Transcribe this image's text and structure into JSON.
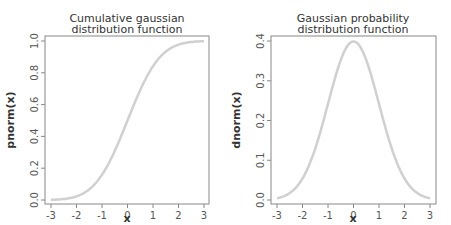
{
  "chart_data": [
    {
      "type": "line",
      "title": "Cumulative gaussian distribution function",
      "title_lines": [
        "Cumulative gaussian",
        "distribution function"
      ],
      "xlabel": "x",
      "ylabel": "pnorm(x)",
      "xlim": [
        -3,
        3
      ],
      "ylim": [
        0,
        1
      ],
      "xticks": [
        -3,
        -2,
        -1,
        0,
        1,
        2,
        3
      ],
      "yticks": [
        0.0,
        0.2,
        0.4,
        0.6,
        0.8,
        1.0
      ],
      "ytick_labels": [
        "0.0",
        "0.2",
        "0.4",
        "0.6",
        "0.8",
        "1.0"
      ],
      "line_color": "#d0d0d0",
      "grid": false,
      "x": [
        -3,
        -2.5,
        -2,
        -1.5,
        -1,
        -0.5,
        0,
        0.5,
        1,
        1.5,
        2,
        2.5,
        3
      ],
      "y": [
        0.001,
        0.006,
        0.023,
        0.067,
        0.159,
        0.309,
        0.5,
        0.691,
        0.841,
        0.933,
        0.977,
        0.994,
        0.999
      ]
    },
    {
      "type": "line",
      "title": "Gaussian probability distribution function",
      "title_lines": [
        "Gaussian probability",
        "distribution function"
      ],
      "xlabel": "x",
      "ylabel": "dnorm(x)",
      "xlim": [
        -3,
        3
      ],
      "ylim": [
        0,
        0.4
      ],
      "xticks": [
        -3,
        -2,
        -1,
        0,
        1,
        2,
        3
      ],
      "yticks": [
        0.0,
        0.1,
        0.2,
        0.3,
        0.4
      ],
      "ytick_labels": [
        "0.0",
        "0.1",
        "0.2",
        "0.3",
        "0.4"
      ],
      "line_color": "#d0d0d0",
      "grid": false,
      "x": [
        -3,
        -2.5,
        -2,
        -1.5,
        -1,
        -0.5,
        0,
        0.5,
        1,
        1.5,
        2,
        2.5,
        3
      ],
      "y": [
        0.004,
        0.018,
        0.054,
        0.13,
        0.242,
        0.352,
        0.399,
        0.352,
        0.242,
        0.13,
        0.054,
        0.018,
        0.004
      ]
    }
  ]
}
